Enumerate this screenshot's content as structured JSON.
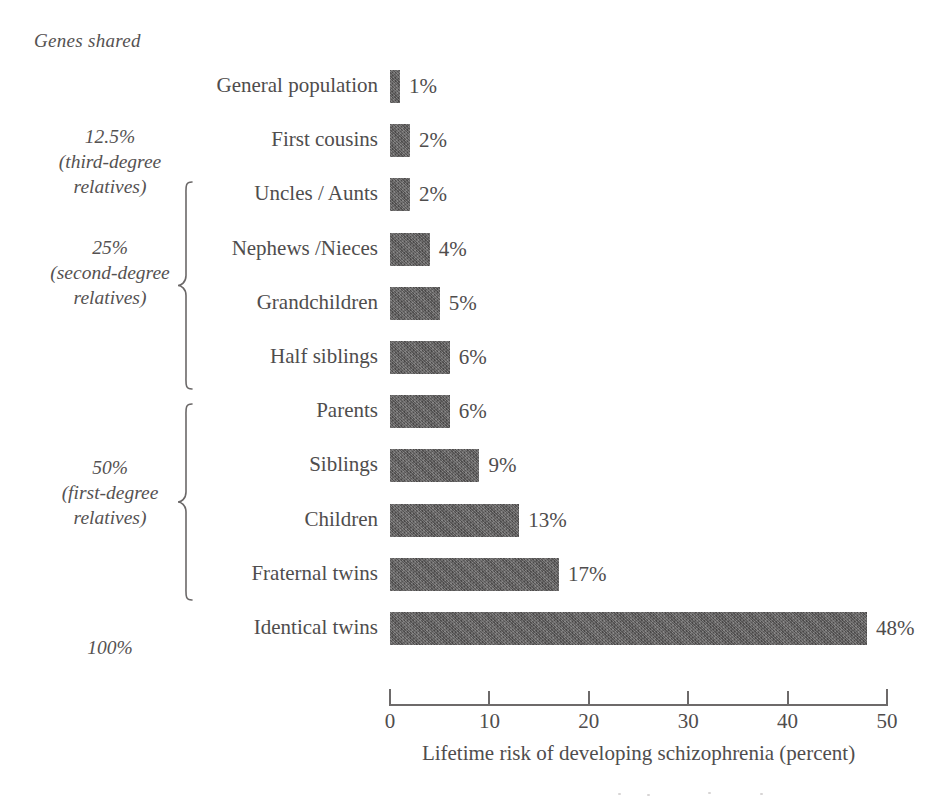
{
  "figure": {
    "genes_shared_heading": "Genes shared",
    "axis_title": "Lifetime risk of developing schizophrenia (percent)"
  },
  "genes_groups": [
    {
      "label": "12.5%\n(third-degree\nrelatives)",
      "brace": false
    },
    {
      "label": "25%\n(second-degree\nrelatives)",
      "brace": true
    },
    {
      "label": "50%\n(first-degree\nrelatives)",
      "brace": true
    },
    {
      "label": "100%",
      "brace": false
    }
  ],
  "chart_data": {
    "type": "bar",
    "orientation": "horizontal",
    "title": "",
    "subtitle": "",
    "xlabel": "Lifetime risk of developing schizophrenia (percent)",
    "ylabel": "Genes shared",
    "xlim": [
      0,
      50
    ],
    "xticks": [
      0,
      10,
      20,
      30,
      40,
      50
    ],
    "xtick_labels": [
      "0",
      "10",
      "20",
      "30",
      "40",
      "50"
    ],
    "grid": false,
    "legend": "none",
    "bar_color": "#5d5b5b",
    "categories": [
      "General population",
      "First cousins",
      "Uncles / Aunts",
      "Nephews /Nieces",
      "Grandchildren",
      "Half siblings",
      "Parents",
      "Siblings",
      "Children",
      "Fraternal twins",
      "Identical twins"
    ],
    "values": [
      1,
      2,
      2,
      4,
      5,
      6,
      6,
      9,
      13,
      17,
      48
    ],
    "data_labels": [
      "1%",
      "2%",
      "2%",
      "4%",
      "5%",
      "6%",
      "6%",
      "9%",
      "13%",
      "17%",
      "48%"
    ],
    "group_annotations": [
      {
        "genes_shared": "12.5%",
        "degree": "third-degree relatives",
        "categories": [
          "First cousins"
        ]
      },
      {
        "genes_shared": "25%",
        "degree": "second-degree relatives",
        "categories": [
          "Uncles / Aunts",
          "Nephews /Nieces",
          "Grandchildren",
          "Half siblings"
        ]
      },
      {
        "genes_shared": "50%",
        "degree": "first-degree relatives",
        "categories": [
          "Parents",
          "Siblings",
          "Children",
          "Fraternal twins"
        ]
      },
      {
        "genes_shared": "100%",
        "degree": "",
        "categories": [
          "Identical twins"
        ]
      }
    ]
  }
}
